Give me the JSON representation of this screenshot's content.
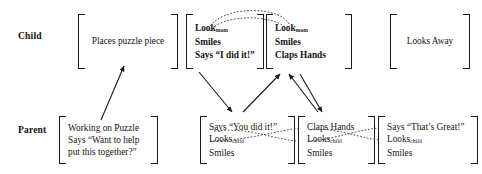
{
  "diagram": {
    "type": "interaction-sequence-diagram",
    "row_labels": {
      "child": "Child",
      "parent": "Parent"
    },
    "child_boxes": [
      {
        "id": "child-places-puzzle-piece",
        "lines": [
          {
            "text": "Places puzzle piece",
            "sub": ""
          }
        ]
      },
      {
        "id": "child-look-smiles-says",
        "lines": [
          {
            "text": "Look",
            "sub": "mom"
          },
          {
            "text": "Smiles",
            "sub": ""
          },
          {
            "text": "Says “I did it!”",
            "sub": ""
          }
        ]
      },
      {
        "id": "child-look-smiles-claps",
        "lines": [
          {
            "text": "Look",
            "sub": "mom"
          },
          {
            "text": "Smiles",
            "sub": ""
          },
          {
            "text": "Claps Hands",
            "sub": ""
          }
        ]
      },
      {
        "id": "child-looks-away",
        "lines": [
          {
            "text": "Looks Away",
            "sub": ""
          }
        ]
      }
    ],
    "parent_boxes": [
      {
        "id": "parent-working-on-puzzle",
        "lines": [
          {
            "text": "Working on Puzzle",
            "sub": ""
          },
          {
            "text": "Says “Want to help",
            "sub": ""
          },
          {
            "text": "put this together?”",
            "sub": ""
          }
        ]
      },
      {
        "id": "parent-says-you-did-it",
        "lines": [
          {
            "text": "Says “You did it!”",
            "sub": ""
          },
          {
            "text": "Looks",
            "sub": "child"
          },
          {
            "text": "Smiles",
            "sub": ""
          }
        ]
      },
      {
        "id": "parent-claps-hands",
        "lines": [
          {
            "text": "Claps Hands",
            "sub": ""
          },
          {
            "text": "Looks",
            "sub": "child"
          },
          {
            "text": "Smiles",
            "sub": ""
          }
        ]
      },
      {
        "id": "parent-says-thats-great",
        "lines": [
          {
            "text": "Says “That’s Great!”",
            "sub": ""
          },
          {
            "text": "Looks",
            "sub": "child"
          },
          {
            "text": "Smiles",
            "sub": ""
          }
        ]
      }
    ],
    "colors": {
      "ink": "#141414",
      "background": "#ffffff"
    }
  }
}
